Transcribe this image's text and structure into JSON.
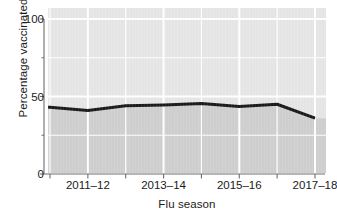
{
  "chart_data": {
    "type": "area",
    "title": "",
    "subtitle": "",
    "xlabel": "Flu season",
    "ylabel": "Percentage vaccinated",
    "categories": [
      "2010–11",
      "2011–12",
      "2012–13",
      "2013–14",
      "2014–15",
      "2015–16",
      "2016–17",
      "2017–18"
    ],
    "values": [
      43,
      41,
      44,
      44.5,
      45.5,
      43.5,
      45,
      36
    ],
    "series": [
      {
        "name": "Percentage vaccinated",
        "values": [
          43,
          41,
          44,
          44.5,
          45.5,
          43.5,
          45,
          36
        ]
      }
    ],
    "ylim": [
      0,
      100
    ],
    "ytick_values": [
      0,
      50,
      100
    ],
    "ytick_labels": [
      "0",
      "50",
      "100"
    ],
    "yminor_tick_values": [
      25,
      75
    ],
    "xtick_labels": [
      "",
      "2011–12",
      "",
      "2013–14",
      "",
      "2015–16",
      "",
      "2017–18"
    ],
    "xtick_labeled": [
      "2011–12",
      "2013–14",
      "2015–16",
      "2017–18"
    ],
    "grid": "horizontal-and-vertical-white",
    "legend": "none",
    "legend_position": "none",
    "line_color": "#1a1a1a",
    "fill_color": "#cfcfcf",
    "panel_color": "#e6e6e6",
    "grid_color": "#ffffff",
    "axis_color": "#6e6e6e"
  },
  "axis": {
    "y_title": "Percentage vaccinated",
    "x_title": "Flu season",
    "y_labels": [
      "100",
      "50",
      "0"
    ],
    "x_labels": [
      "2011–12",
      "2013–14",
      "2015–16",
      "2017–18"
    ]
  }
}
